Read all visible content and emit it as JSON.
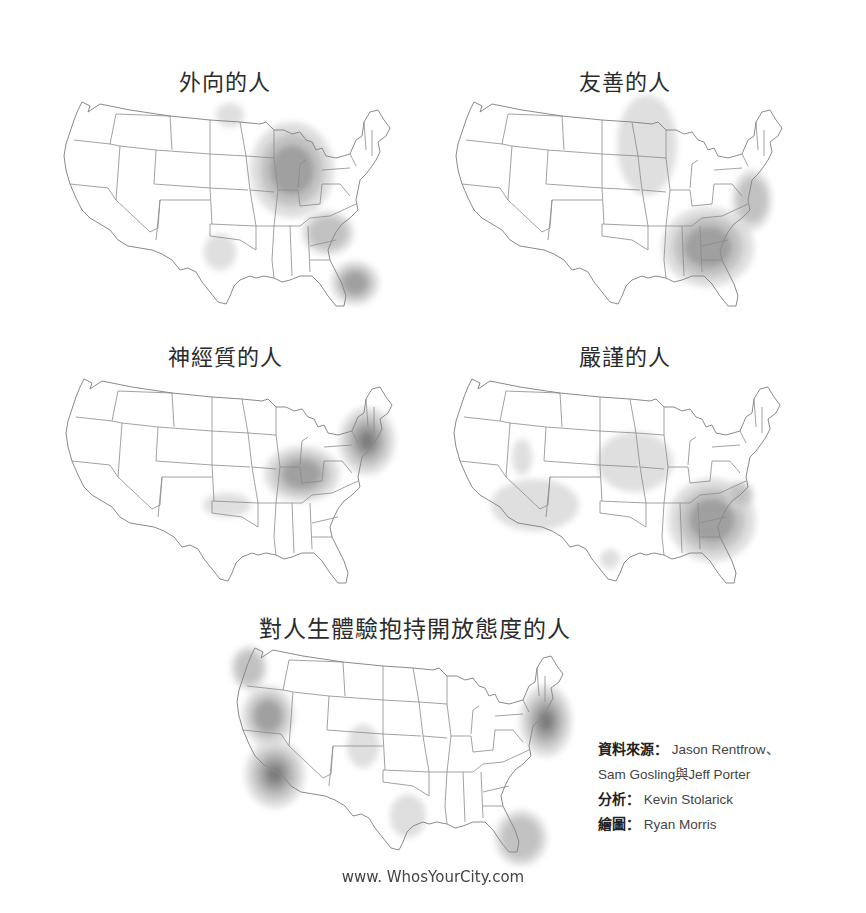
{
  "maps": [
    {
      "title": "外向的人",
      "hotspots": [
        {
          "cx": 232,
          "cy": 70,
          "rx": 42,
          "ry": 48,
          "level": 3
        },
        {
          "cx": 268,
          "cy": 133,
          "rx": 26,
          "ry": 22,
          "level": 2
        },
        {
          "cx": 295,
          "cy": 183,
          "rx": 24,
          "ry": 22,
          "level": 3
        },
        {
          "cx": 160,
          "cy": 152,
          "rx": 16,
          "ry": 18,
          "level": 1
        },
        {
          "cx": 170,
          "cy": 15,
          "rx": 14,
          "ry": 12,
          "level": 1
        }
      ]
    },
    {
      "title": "友善的人",
      "hotspots": [
        {
          "cx": 256,
          "cy": 147,
          "rx": 46,
          "ry": 40,
          "level": 3
        },
        {
          "cx": 195,
          "cy": 45,
          "rx": 30,
          "ry": 50,
          "level": 1
        },
        {
          "cx": 300,
          "cy": 100,
          "rx": 20,
          "ry": 30,
          "level": 2
        }
      ]
    },
    {
      "title": "神經質的人",
      "hotspots": [
        {
          "cx": 240,
          "cy": 97,
          "rx": 38,
          "ry": 28,
          "level": 3
        },
        {
          "cx": 305,
          "cy": 64,
          "rx": 28,
          "ry": 34,
          "level": 4
        },
        {
          "cx": 165,
          "cy": 128,
          "rx": 24,
          "ry": 12,
          "level": 1
        }
      ]
    },
    {
      "title": "嚴謹的人",
      "hotspots": [
        {
          "cx": 262,
          "cy": 143,
          "rx": 44,
          "ry": 42,
          "level": 3
        },
        {
          "cx": 290,
          "cy": 118,
          "rx": 14,
          "ry": 14,
          "level": 2
        },
        {
          "cx": 185,
          "cy": 85,
          "rx": 38,
          "ry": 30,
          "level": 1
        },
        {
          "cx": 85,
          "cy": 128,
          "rx": 44,
          "ry": 26,
          "level": 1
        },
        {
          "cx": 72,
          "cy": 80,
          "rx": 10,
          "ry": 18,
          "level": 1
        },
        {
          "cx": 160,
          "cy": 182,
          "rx": 10,
          "ry": 10,
          "level": 1
        }
      ]
    },
    {
      "title": "對人生體驗抱持開放態度的人",
      "hotspots": [
        {
          "cx": 35,
          "cy": 70,
          "rx": 26,
          "ry": 30,
          "level": 3
        },
        {
          "cx": 42,
          "cy": 128,
          "rx": 30,
          "ry": 34,
          "level": 4
        },
        {
          "cx": 16,
          "cy": 22,
          "rx": 18,
          "ry": 22,
          "level": 2
        },
        {
          "cx": 313,
          "cy": 75,
          "rx": 26,
          "ry": 36,
          "level": 4
        },
        {
          "cx": 288,
          "cy": 192,
          "rx": 26,
          "ry": 28,
          "level": 2
        },
        {
          "cx": 130,
          "cy": 100,
          "rx": 16,
          "ry": 22,
          "level": 1
        },
        {
          "cx": 175,
          "cy": 170,
          "rx": 18,
          "ry": 22,
          "level": 1
        }
      ]
    }
  ],
  "credits": {
    "source_label": "資料來源",
    "source_value": "Jason Rentfrow、",
    "source_value_2": "Sam Gosling與Jeff Porter",
    "analysis_label": "分析",
    "analysis_value": "Kevin Stolarick",
    "graphics_label": "繪圖",
    "graphics_value": "Ryan Morris",
    "separator": "："
  },
  "footer": {
    "url": "www. WhosYourCity.com"
  },
  "colors": {
    "level1": "#d9d9d9",
    "level2": "#bdbdbd",
    "level3": "#9b9b9b",
    "level4": "#777777",
    "outline": "#8a8a8a"
  }
}
